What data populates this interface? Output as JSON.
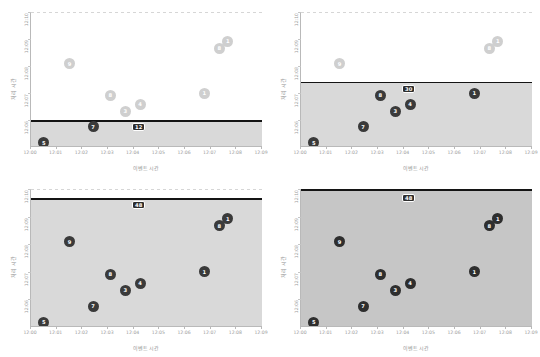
{
  "figure": {
    "caption": "",
    "xlabel": "이벤트 시간",
    "ylabel": "처리 시간",
    "xticks": [
      "12:00",
      "12:01",
      "12:02",
      "12:03",
      "12:04",
      "12:05",
      "12:06",
      "12:07",
      "12:08",
      "12:09"
    ],
    "yticks_tl": [
      "12:10",
      "12:09",
      "12:08",
      "12:07",
      "12:06"
    ],
    "yticks_tr": [
      "12:10",
      "12:09",
      "12:08",
      "12:07",
      "12:06"
    ],
    "yticks_bl": [
      "12:10",
      "12:09",
      "12:08",
      "12:07",
      "12:06"
    ],
    "yticks_br": [
      "12:10",
      "12:09",
      "12:08",
      "12:07",
      "12:06"
    ],
    "colors": {
      "marker_light": "#cfcfcf",
      "marker_dark": "#3a3a3a",
      "threshold_line": "#141414",
      "shade": "#d9d9d9",
      "shade_dark": "#c6c6c6",
      "axis": "#b9b9b9"
    }
  },
  "chart_data": [
    {
      "type": "scatter",
      "panel": "top-left",
      "title": "",
      "xlabel": "이벤트 시간",
      "ylabel": "처리 시간",
      "xlim": [
        "12:00",
        "12:09"
      ],
      "ylim": [
        "12:05",
        "12:10"
      ],
      "grid": false,
      "threshold_y": "12:06",
      "shaded_below_threshold": true,
      "points": [
        {
          "label": "9",
          "x": "12:01:30",
          "y": "12:08:05",
          "state": "pending"
        },
        {
          "label": "8",
          "x": "12:03:05",
          "y": "12:06:55",
          "state": "pending"
        },
        {
          "label": "3",
          "x": "12:03:40",
          "y": "12:06:20",
          "state": "pending"
        },
        {
          "label": "4",
          "x": "12:04:15",
          "y": "12:06:35",
          "state": "pending"
        },
        {
          "label": "1",
          "x": "12:06:45",
          "y": "12:07:00",
          "state": "pending"
        },
        {
          "label": "8",
          "x": "12:07:20",
          "y": "12:08:40",
          "state": "pending"
        },
        {
          "label": "1",
          "x": "12:07:40",
          "y": "12:08:55",
          "state": "pending"
        },
        {
          "label": "5",
          "x": "12:00:30",
          "y": "12:05:10",
          "state": "emitted"
        },
        {
          "label": "7",
          "x": "12:02:25",
          "y": "12:05:45",
          "state": "emitted"
        },
        {
          "label": "12",
          "x": "12:04:15",
          "y": "12:05:45",
          "state": "watermark"
        }
      ]
    },
    {
      "type": "scatter",
      "panel": "top-right",
      "title": "",
      "xlabel": "이벤트 시간",
      "ylabel": "처리 시간",
      "xlim": [
        "12:00",
        "12:09"
      ],
      "ylim": [
        "12:05",
        "12:10"
      ],
      "grid": false,
      "threshold_y": "12:07:25",
      "shaded_below_threshold": true,
      "points": [
        {
          "label": "9",
          "x": "12:01:30",
          "y": "12:08:05",
          "state": "pending"
        },
        {
          "label": "8",
          "x": "12:07:20",
          "y": "12:08:40",
          "state": "pending"
        },
        {
          "label": "1",
          "x": "12:07:40",
          "y": "12:08:55",
          "state": "pending"
        },
        {
          "label": "5",
          "x": "12:00:30",
          "y": "12:05:10",
          "state": "emitted"
        },
        {
          "label": "7",
          "x": "12:02:25",
          "y": "12:05:45",
          "state": "emitted"
        },
        {
          "label": "3",
          "x": "12:03:40",
          "y": "12:06:20",
          "state": "emitted"
        },
        {
          "label": "4",
          "x": "12:04:15",
          "y": "12:06:35",
          "state": "emitted"
        },
        {
          "label": "8",
          "x": "12:03:05",
          "y": "12:06:55",
          "state": "emitted"
        },
        {
          "label": "1",
          "x": "12:06:45",
          "y": "12:07:00",
          "state": "emitted"
        },
        {
          "label": "30",
          "x": "12:04:15",
          "y": "12:07:10",
          "state": "watermark"
        }
      ]
    },
    {
      "type": "scatter",
      "panel": "bottom-left",
      "title": "",
      "xlabel": "이벤트 시간",
      "ylabel": "처리 시간",
      "xlim": [
        "12:00",
        "12:09"
      ],
      "ylim": [
        "12:05",
        "12:10"
      ],
      "grid": false,
      "threshold_y": "12:09:40",
      "shaded_below_threshold": true,
      "points": [
        {
          "label": "9",
          "x": "12:01:30",
          "y": "12:08:05",
          "state": "emitted"
        },
        {
          "label": "8",
          "x": "12:03:05",
          "y": "12:06:55",
          "state": "emitted"
        },
        {
          "label": "3",
          "x": "12:03:40",
          "y": "12:06:20",
          "state": "emitted"
        },
        {
          "label": "4",
          "x": "12:04:15",
          "y": "12:06:35",
          "state": "emitted"
        },
        {
          "label": "1",
          "x": "12:06:45",
          "y": "12:07:00",
          "state": "emitted"
        },
        {
          "label": "8",
          "x": "12:07:20",
          "y": "12:08:40",
          "state": "emitted"
        },
        {
          "label": "1",
          "x": "12:07:40",
          "y": "12:08:55",
          "state": "emitted"
        },
        {
          "label": "5",
          "x": "12:00:30",
          "y": "12:05:10",
          "state": "emitted"
        },
        {
          "label": "7",
          "x": "12:02:25",
          "y": "12:05:45",
          "state": "emitted"
        },
        {
          "label": "48",
          "x": "12:04:15",
          "y": "12:09:25",
          "state": "watermark"
        }
      ]
    },
    {
      "type": "scatter",
      "panel": "bottom-right",
      "title": "",
      "xlabel": "이벤트 시간",
      "ylabel": "처리 시간",
      "xlim": [
        "12:00",
        "12:09"
      ],
      "ylim": [
        "12:05",
        "12:10"
      ],
      "grid": false,
      "threshold_y": "12:10",
      "shaded_below_threshold": true,
      "points": [
        {
          "label": "9",
          "x": "12:01:30",
          "y": "12:08:05",
          "state": "emitted"
        },
        {
          "label": "8",
          "x": "12:03:05",
          "y": "12:06:55",
          "state": "emitted"
        },
        {
          "label": "3",
          "x": "12:03:40",
          "y": "12:06:20",
          "state": "emitted"
        },
        {
          "label": "4",
          "x": "12:04:15",
          "y": "12:06:35",
          "state": "emitted"
        },
        {
          "label": "1",
          "x": "12:06:45",
          "y": "12:07:00",
          "state": "emitted"
        },
        {
          "label": "8",
          "x": "12:07:20",
          "y": "12:08:40",
          "state": "emitted"
        },
        {
          "label": "1",
          "x": "12:07:40",
          "y": "12:08:55",
          "state": "emitted"
        },
        {
          "label": "5",
          "x": "12:00:30",
          "y": "12:05:10",
          "state": "emitted"
        },
        {
          "label": "7",
          "x": "12:02:25",
          "y": "12:05:45",
          "state": "emitted"
        },
        {
          "label": "48",
          "x": "12:04:15",
          "y": "12:09:40",
          "state": "watermark"
        }
      ]
    }
  ]
}
